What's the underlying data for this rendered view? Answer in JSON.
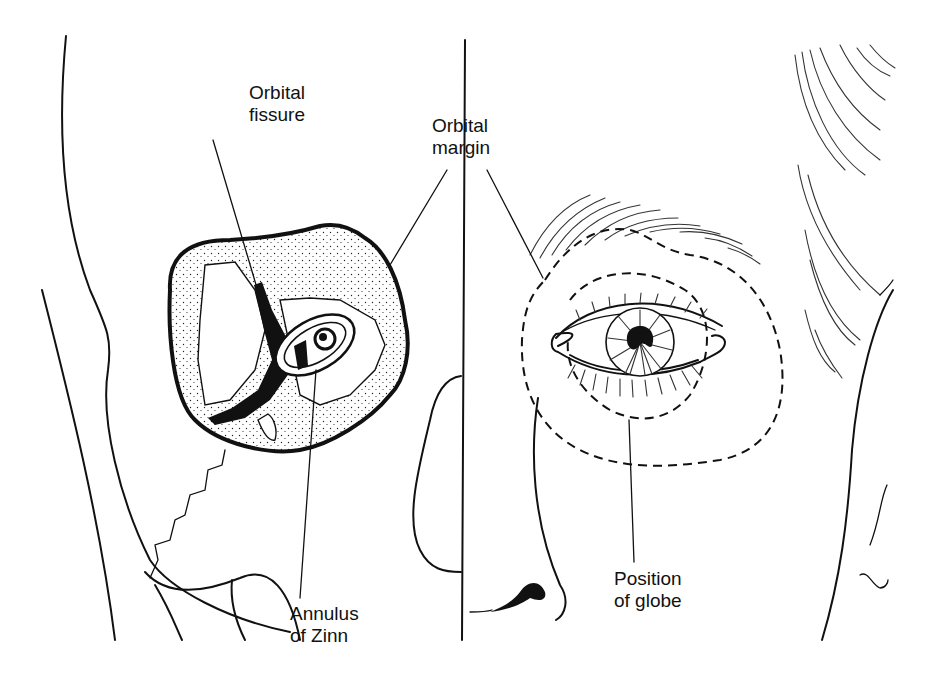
{
  "figure": {
    "colors": {
      "ink": "#111111",
      "background": "#ffffff"
    }
  },
  "labels": {
    "orbital_fissure": {
      "line1": "Orbital",
      "line2": "fissure"
    },
    "orbital_margin": {
      "line1": "Orbital",
      "line2": "margin"
    },
    "annulus_of_zinn": {
      "line1": "Annulus",
      "line2": "of Zinn"
    },
    "position_of_globe": {
      "line1": "Position",
      "line2": "of globe"
    }
  }
}
